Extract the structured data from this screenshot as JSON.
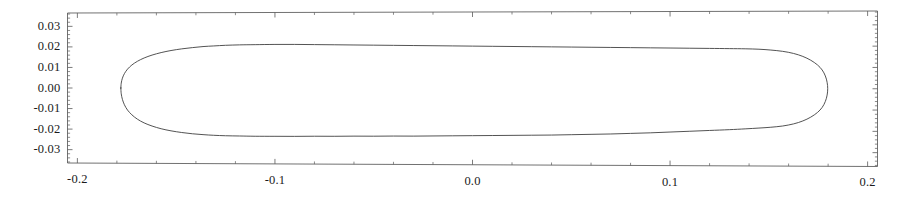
{
  "chart_data": {
    "type": "line",
    "title": "",
    "xlabel": "",
    "ylabel": "",
    "xlim": [
      -0.205,
      0.205
    ],
    "ylim": [
      -0.0365,
      0.0365
    ],
    "grid": false,
    "legend": null,
    "frame": "box-with-inward-ticks",
    "line_color": "#404040",
    "background_color": "#ffffff",
    "xticks": [
      -0.2,
      -0.1,
      0.0,
      0.1,
      0.2
    ],
    "xtick_labels": [
      "-0.2",
      "-0.1",
      "0.0",
      "0.1",
      "0.2"
    ],
    "yticks": [
      -0.03,
      -0.02,
      -0.01,
      0.0,
      0.01,
      0.02,
      0.03
    ],
    "ytick_labels": [
      "-0.03",
      "-0.02",
      "-0.01",
      "0.00",
      "0.01",
      "0.02",
      "0.03"
    ],
    "x_minor_ticks_per_major": 5,
    "y_minor_ticks_per_major": 5,
    "series": [
      {
        "name": "closed-contour",
        "closed": true,
        "description": "closed stadium/capsule shaped contour",
        "x": [
          -0.178,
          -0.1778,
          -0.1772,
          -0.1762,
          -0.1746,
          -0.1724,
          -0.1696,
          -0.1662,
          -0.1622,
          -0.1576,
          -0.1526,
          -0.1472,
          -0.1418,
          -0.1364,
          -0.131,
          -0.125,
          -0.118,
          -0.11,
          -0.1,
          -0.09,
          -0.08,
          -0.07,
          -0.06,
          -0.05,
          -0.04,
          -0.03,
          -0.02,
          -0.01,
          0.0,
          0.01,
          0.02,
          0.03,
          0.04,
          0.05,
          0.06,
          0.07,
          0.08,
          0.09,
          0.1,
          0.11,
          0.12,
          0.13,
          0.138,
          0.145,
          0.151,
          0.157,
          0.1625,
          0.1672,
          0.1712,
          0.1746,
          0.177,
          0.1786,
          0.1795,
          0.1798,
          0.1795,
          0.1786,
          0.177,
          0.1746,
          0.1712,
          0.1672,
          0.1625,
          0.157,
          0.151,
          0.145,
          0.138,
          0.13,
          0.12,
          0.11,
          0.1,
          0.09,
          0.08,
          0.07,
          0.06,
          0.05,
          0.04,
          0.03,
          0.02,
          0.01,
          0.0,
          -0.01,
          -0.02,
          -0.03,
          -0.04,
          -0.05,
          -0.06,
          -0.07,
          -0.08,
          -0.09,
          -0.1,
          -0.11,
          -0.118,
          -0.125,
          -0.131,
          -0.1364,
          -0.1418,
          -0.1472,
          -0.1526,
          -0.1576,
          -0.1622,
          -0.1662,
          -0.1696,
          -0.1724,
          -0.1746,
          -0.1762,
          -0.1772,
          -0.1778,
          -0.178
        ],
        "y": [
          0.0,
          0.0024,
          0.0048,
          0.007,
          0.0092,
          0.0112,
          0.013,
          0.0146,
          0.016,
          0.0172,
          0.0182,
          0.019,
          0.0196,
          0.0201,
          0.0204,
          0.0207,
          0.0209,
          0.021,
          0.0211,
          0.0211,
          0.021,
          0.0209,
          0.0208,
          0.0207,
          0.0206,
          0.0205,
          0.0204,
          0.0203,
          0.0202,
          0.0201,
          0.02,
          0.0199,
          0.0198,
          0.0197,
          0.0196,
          0.0195,
          0.0194,
          0.0193,
          0.0192,
          0.0191,
          0.019,
          0.0189,
          0.0188,
          0.0186,
          0.0182,
          0.0176,
          0.0166,
          0.0152,
          0.0134,
          0.0112,
          0.0088,
          0.006,
          0.003,
          0.0,
          -0.003,
          -0.006,
          -0.0088,
          -0.0112,
          -0.0134,
          -0.0152,
          -0.0166,
          -0.0176,
          -0.0182,
          -0.0186,
          -0.019,
          -0.0194,
          -0.0198,
          -0.0202,
          -0.0206,
          -0.021,
          -0.0213,
          -0.0216,
          -0.0218,
          -0.022,
          -0.0222,
          -0.0223,
          -0.0224,
          -0.0225,
          -0.0226,
          -0.0227,
          -0.0228,
          -0.0229,
          -0.0229,
          -0.023,
          -0.023,
          -0.0231,
          -0.0231,
          -0.0232,
          -0.0232,
          -0.0232,
          -0.0231,
          -0.023,
          -0.0228,
          -0.0225,
          -0.0221,
          -0.0215,
          -0.0207,
          -0.0197,
          -0.0184,
          -0.0169,
          -0.0151,
          -0.013,
          -0.0107,
          -0.0081,
          -0.0055,
          -0.0028,
          0.0
        ]
      }
    ],
    "extent": {
      "x_min": -0.178,
      "x_max": 0.1798,
      "y_min": -0.0232,
      "y_max": 0.0211
    }
  }
}
